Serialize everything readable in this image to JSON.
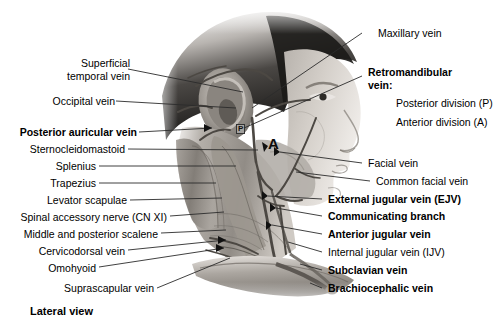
{
  "figure": {
    "caption": "Lateral view"
  },
  "image_markers": [
    {
      "text": "P",
      "meaning": "posterior-division-marker"
    },
    {
      "text": "A",
      "meaning": "anterior-division-marker"
    }
  ],
  "labels_left": [
    {
      "id": "superficial-temporal-vein",
      "line1": "Superficial",
      "line2": "temporal vein",
      "bold": false
    },
    {
      "id": "occipital-vein",
      "line1": "Occipital vein",
      "line2": "",
      "bold": false
    },
    {
      "id": "posterior-auricular-vein",
      "line1": "Posterior auricular vein",
      "line2": "",
      "bold": true
    },
    {
      "id": "sternocleidomastoid",
      "line1": "Sternocleidomastoid",
      "line2": "",
      "bold": false
    },
    {
      "id": "splenius",
      "line1": "Splenius",
      "line2": "",
      "bold": false
    },
    {
      "id": "trapezius",
      "line1": "Trapezius",
      "line2": "",
      "bold": false
    },
    {
      "id": "levator-scapulae",
      "line1": "Levator scapulae",
      "line2": "",
      "bold": false
    },
    {
      "id": "spinal-accessory-nerve",
      "line1": "Spinal accessory nerve (CN XI)",
      "line2": "",
      "bold": false
    },
    {
      "id": "middle-and-posterior-scalene",
      "line1": "Middle and posterior scalene",
      "line2": "",
      "bold": false
    },
    {
      "id": "cervicodorsal-vein",
      "line1": "Cervicodorsal vein",
      "line2": "",
      "bold": false
    },
    {
      "id": "omohyoid",
      "line1": "Omohyoid",
      "line2": "",
      "bold": false
    },
    {
      "id": "suprascapular-vein",
      "line1": "Suprascapular vein",
      "line2": "",
      "bold": false
    }
  ],
  "labels_right": [
    {
      "id": "maxillary-vein",
      "text": "Maxillary vein",
      "bold": false,
      "indent": false
    },
    {
      "id": "retromandibular-vein",
      "text": "Retromandibular",
      "bold": true,
      "indent": false
    },
    {
      "id": "retromandibular-vein-2",
      "text": "vein:",
      "bold": true,
      "indent": false
    },
    {
      "id": "posterior-division",
      "text": "Posterior division (P)",
      "bold": false,
      "indent": true
    },
    {
      "id": "anterior-division",
      "text": "Anterior division (A)",
      "bold": false,
      "indent": true
    },
    {
      "id": "facial-vein",
      "text": "Facial vein",
      "bold": false,
      "indent": false
    },
    {
      "id": "common-facial-vein",
      "text": "Common facial vein",
      "bold": false,
      "indent": false
    },
    {
      "id": "external-jugular-vein",
      "text": "External jugular vein (EJV)",
      "bold": true,
      "indent": false
    },
    {
      "id": "communicating-branch",
      "text": "Communicating branch",
      "bold": true,
      "indent": false
    },
    {
      "id": "anterior-jugular-vein",
      "text": "Anterior jugular vein",
      "bold": true,
      "indent": false
    },
    {
      "id": "internal-jugular-vein",
      "text": "Internal jugular vein (IJV)",
      "bold": false,
      "indent": false
    },
    {
      "id": "subclavian-vein",
      "text": "Subclavian vein",
      "bold": true,
      "indent": false
    },
    {
      "id": "brachiocephalic-vein",
      "text": "Brachiocephalic vein",
      "bold": true,
      "indent": false
    }
  ],
  "colors": {
    "background": "#ffffff",
    "text": "#000000",
    "leader_line": "#2b2b2b",
    "skin_light": "#d8d4cf",
    "skin_mid": "#a9a49e",
    "skin_dark": "#6e6a66",
    "hair_dark": "#1c1a19",
    "muscle": "#8f8a84",
    "vessel": "#5a5550"
  }
}
